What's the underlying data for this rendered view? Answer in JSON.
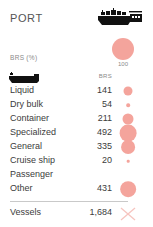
{
  "header": {
    "title": "PORT",
    "icon": "cargo-ship-icon"
  },
  "legend": {
    "axis_label": "BRS (%)",
    "max_value": "100",
    "bubble_color": "#f4a49c"
  },
  "table": {
    "row_icon": "tanker-vessel-icon",
    "value_column_header": "BRS",
    "rows": [
      {
        "label": "Liquid",
        "value": "141",
        "size": 9.0
      },
      {
        "label": "Dry bulk",
        "value": "54",
        "size": 3.6
      },
      {
        "label": "Container",
        "value": "211",
        "size": 11.0
      },
      {
        "label": "Specialized",
        "value": "492",
        "size": 16.8
      },
      {
        "label": "General",
        "value": "335",
        "size": 13.8
      },
      {
        "label": "Cruise ship",
        "value": "20",
        "size": 2.6
      },
      {
        "label": "Passenger",
        "value": "",
        "size": 0
      },
      {
        "label": "Other",
        "value": "431",
        "size": 15.7
      }
    ]
  },
  "footer": {
    "label": "Vessels",
    "value": "1,684",
    "mark": "x-mark-icon",
    "mark_color": "#f6c4bf"
  },
  "colors": {
    "accent": "#f4a49c",
    "text": "#3c3c3c",
    "muted": "#8a8a8a",
    "divider": "#c9c9c9",
    "background": "#ffffff"
  }
}
